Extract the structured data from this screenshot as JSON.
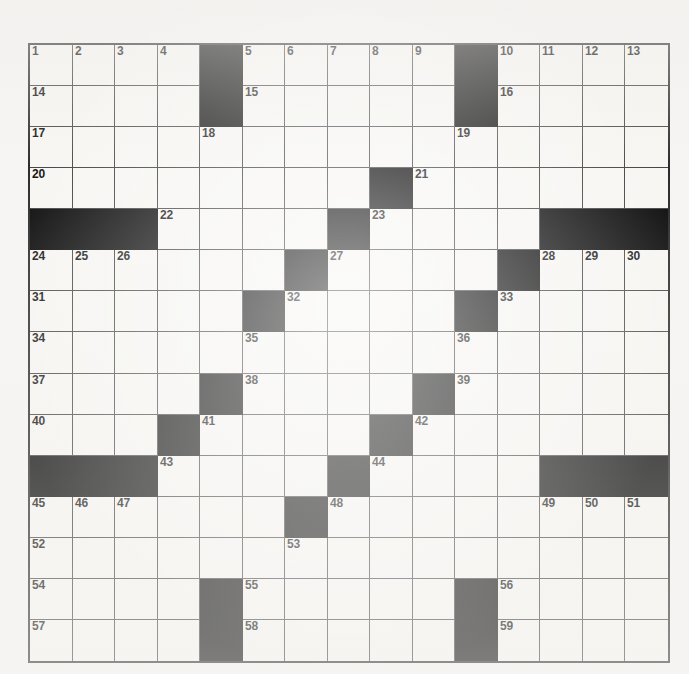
{
  "page": {
    "background_color": "#f6f5f3",
    "grid_border_color": "#2b2b2b",
    "cell_line_color": "#444444",
    "block_color": "#0b0b0b",
    "cell_fill_color": "#f7f6f3",
    "number_color": "#131313"
  },
  "grid": {
    "columns": 15,
    "rows": 15,
    "left_px": 28,
    "top_px": 43,
    "width_px": 642,
    "height_px": 620,
    "highest_clue_number": 59,
    "block_count": 60,
    "legend": {
      "block": "black square (no letter)",
      "open": "white square (letter cell)"
    },
    "layout": [
      [
        "1",
        "2",
        "3",
        "4",
        "#",
        "5",
        "6",
        "7",
        "8",
        "9",
        "#",
        "10",
        "11",
        "12",
        "13"
      ],
      [
        "14",
        "",
        "",
        "",
        "#",
        "15",
        "",
        "",
        "",
        "",
        "#",
        "16",
        "",
        "",
        ""
      ],
      [
        "17",
        "",
        "",
        "",
        "18",
        "",
        "",
        "",
        "",
        "",
        "19",
        "",
        "",
        "",
        ""
      ],
      [
        "20",
        "",
        "",
        "",
        "",
        "",
        "",
        "",
        "#",
        "21",
        "",
        "",
        "",
        "",
        ""
      ],
      [
        "#",
        "#",
        "#",
        "22",
        "",
        "",
        "",
        "#",
        "23",
        "",
        "",
        "",
        "#",
        "#",
        "#"
      ],
      [
        "24",
        "25",
        "26",
        "",
        "",
        "",
        "#",
        "27",
        "",
        "",
        "",
        "#",
        "28",
        "29",
        "30"
      ],
      [
        "31",
        "",
        "",
        "",
        "",
        "#",
        "32",
        "",
        "",
        "",
        "#",
        "33",
        "",
        "",
        ""
      ],
      [
        "34",
        "",
        "",
        "",
        "",
        "35",
        "",
        "",
        "",
        "",
        "36",
        "",
        "",
        "",
        ""
      ],
      [
        "37",
        "",
        "",
        "",
        "#",
        "38",
        "",
        "",
        "",
        "#",
        "39",
        "",
        "",
        "",
        ""
      ],
      [
        "40",
        "",
        "",
        "#",
        "41",
        "",
        "",
        "",
        "#",
        "42",
        "",
        "",
        "",
        "",
        ""
      ],
      [
        "#",
        "#",
        "#",
        "43",
        "",
        "",
        "",
        "#",
        "44",
        "",
        "",
        "",
        "#",
        "#",
        "#"
      ],
      [
        "45",
        "46",
        "47",
        "",
        "",
        "",
        "#",
        "48",
        "",
        "",
        "",
        "",
        "49",
        "50",
        "51"
      ],
      [
        "52",
        "",
        "",
        "",
        "",
        "",
        "53",
        "",
        "",
        "",
        "",
        "",
        "",
        "",
        ""
      ],
      [
        "54",
        "",
        "",
        "",
        "#",
        "55",
        "",
        "",
        "",
        "",
        "#",
        "56",
        "",
        "",
        ""
      ],
      [
        "57",
        "",
        "",
        "",
        "#",
        "58",
        "",
        "",
        "",
        "",
        "#",
        "59",
        "",
        "",
        ""
      ]
    ]
  }
}
